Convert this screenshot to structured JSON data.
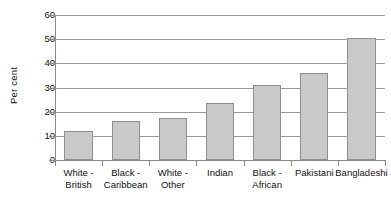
{
  "chart_data": {
    "type": "bar",
    "title": "",
    "subtitle": "",
    "xlabel": "",
    "ylabel": "Per cent",
    "ylim": [
      0,
      60
    ],
    "ytick_step": 10,
    "yticks": [
      "0",
      "10",
      "20",
      "30",
      "40",
      "50",
      "60"
    ],
    "grid": "horizontal",
    "legend": "none",
    "categories": [
      "White - British",
      "Black - Caribbean",
      "White - Other",
      "Indian",
      "Black - African",
      "Pakistani",
      "Bangladeshi"
    ],
    "category_lines": [
      [
        "White -",
        "British"
      ],
      [
        "Black -",
        "Caribbean"
      ],
      [
        "White -",
        "Other"
      ],
      [
        "Indian",
        ""
      ],
      [
        "Black -",
        "African"
      ],
      [
        "Pakistani",
        ""
      ],
      [
        "Bangladeshi",
        ""
      ]
    ],
    "values": [
      12.2,
      16.0,
      17.2,
      23.4,
      31.0,
      36.2,
      50.5
    ],
    "series": [
      {
        "name": "Per cent",
        "values": [
          12.2,
          16.0,
          17.2,
          23.4,
          31.0,
          36.2,
          50.5
        ]
      }
    ],
    "colors": {
      "bar_fill": "#c9c9c9",
      "bar_border": "#8f8f8f",
      "gridline": "#9a9a9a",
      "axis": "#8a8a8a",
      "text": "#111111",
      "background": "#ffffff"
    }
  }
}
